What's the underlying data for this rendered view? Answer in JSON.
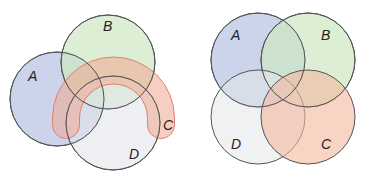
{
  "diagrams": [
    {
      "name": "left-venn",
      "sets": [
        {
          "label": "A",
          "shape": "circle",
          "fill": "#b9c6e4"
        },
        {
          "label": "B",
          "shape": "circle",
          "fill": "#cde8c2"
        },
        {
          "label": "C",
          "shape": "horseshoe",
          "fill": "#f0a890",
          "stroke": "#e08070"
        },
        {
          "label": "D",
          "shape": "circle",
          "fill": "#e2e5ea"
        }
      ]
    },
    {
      "name": "right-venn",
      "sets": [
        {
          "label": "A",
          "shape": "circle",
          "fill": "#b9c6e4"
        },
        {
          "label": "B",
          "shape": "circle",
          "fill": "#cde8c2"
        },
        {
          "label": "C",
          "shape": "circle",
          "fill": "#f3b89e"
        },
        {
          "label": "D",
          "shape": "circle",
          "fill": "#e2e5ea"
        }
      ]
    }
  ]
}
